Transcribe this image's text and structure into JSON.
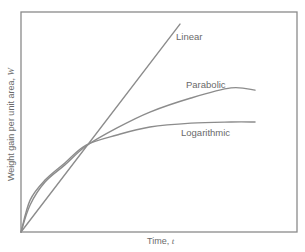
{
  "chart_data": {
    "type": "line",
    "title": "",
    "xlabel": "Time, t",
    "ylabel": "Weight gain per unit area, W",
    "xlim": [
      0,
      100
    ],
    "ylim": [
      0,
      100
    ],
    "grid": false,
    "legend": "inline labels",
    "ticks": "none",
    "series": [
      {
        "name": "Linear",
        "x": [
          0,
          57.6
        ],
        "y": [
          0,
          94.5
        ]
      },
      {
        "name": "Parabolic",
        "x": [
          0,
          3.3,
          8.7,
          15.9,
          23.6,
          34.8,
          46.7,
          61.6,
          76.1,
          84.8
        ],
        "y": [
          0,
          12.3,
          22.7,
          30.5,
          39.1,
          47.3,
          54.5,
          60.9,
          65.5,
          64.5
        ]
      },
      {
        "name": "Logarithmic",
        "x": [
          0,
          3.3,
          8.7,
          15.9,
          23.6,
          34.8,
          46.7,
          61.6,
          76.1,
          84.8
        ],
        "y": [
          0,
          14.5,
          23.6,
          31.4,
          39.5,
          44.1,
          47.7,
          49.5,
          50.0,
          50.0
        ]
      }
    ],
    "annotations": [
      {
        "text": "Linear",
        "near_series": "Linear"
      },
      {
        "text": "Parabolic",
        "near_series": "Parabolic"
      },
      {
        "text": "Logarithmic",
        "near_series": "Logarithmic"
      }
    ]
  },
  "labels": {
    "linear": "Linear",
    "parabolic": "Parabolic",
    "logarithmic": "Logarithmic",
    "xaxis": "Time, t",
    "yaxis": "Weight gain per unit area, W"
  },
  "colors": {
    "curve": "#8c8c8c",
    "axis": "#8a8a8a",
    "text": "#6a6a6a"
  }
}
